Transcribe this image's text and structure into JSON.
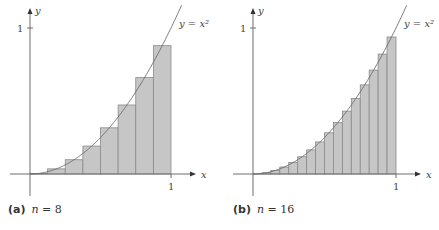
{
  "chart_data": [
    {
      "type": "bar",
      "title": "",
      "caption_tag": "(a)",
      "caption_var": "n",
      "caption_eq": "=",
      "caption_value": "8",
      "function_label": "y = x²",
      "xlabel": "x",
      "ylabel": "y",
      "x_tick_labels": [
        "1"
      ],
      "y_tick_labels": [
        "1"
      ],
      "xlim": [
        0,
        1
      ],
      "ylim": [
        0,
        1
      ],
      "n": 8,
      "rule": "midpoint",
      "categories": [
        0.0625,
        0.1875,
        0.3125,
        0.4375,
        0.5625,
        0.6875,
        0.8125,
        0.9375
      ],
      "values": [
        0.0039,
        0.0352,
        0.0977,
        0.1914,
        0.3164,
        0.4727,
        0.6602,
        0.8789
      ],
      "grid": false
    },
    {
      "type": "bar",
      "title": "",
      "caption_tag": "(b)",
      "caption_var": "n",
      "caption_eq": "=",
      "caption_value": "16",
      "function_label": "y = x²",
      "xlabel": "x",
      "ylabel": "y",
      "x_tick_labels": [
        "1"
      ],
      "y_tick_labels": [
        "1"
      ],
      "xlim": [
        0,
        1
      ],
      "ylim": [
        0,
        1
      ],
      "n": 16,
      "rule": "midpoint",
      "categories": [
        0.03125,
        0.09375,
        0.15625,
        0.21875,
        0.28125,
        0.34375,
        0.40625,
        0.46875,
        0.53125,
        0.59375,
        0.65625,
        0.71875,
        0.78125,
        0.84375,
        0.90625,
        0.96875
      ],
      "values": [
        0.001,
        0.0088,
        0.0244,
        0.0479,
        0.0791,
        0.1182,
        0.165,
        0.2197,
        0.2822,
        0.3525,
        0.4307,
        0.5166,
        0.6104,
        0.7119,
        0.8213,
        0.9385
      ],
      "grid": false
    }
  ],
  "colors": {
    "bar_fill": "#c6c6c6",
    "bar_stroke": "#8a8a8a",
    "axis": "#6e6e6e",
    "curve": "#6a6a6a"
  }
}
